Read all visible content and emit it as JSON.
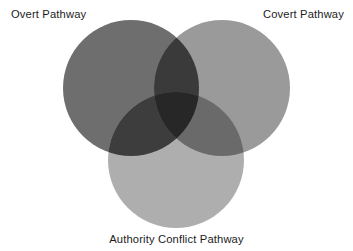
{
  "figure": {
    "type": "venn-diagram",
    "background_color": "#ffffff",
    "text_color": "#1c1c1c",
    "width": 353,
    "height": 251
  },
  "labels": {
    "overt": "Overt Pathway",
    "covert": "Covert Pathway",
    "authority": "Authority Conflict Pathway"
  },
  "chart_data": {
    "type": "venn",
    "title": "",
    "sets": [
      {
        "id": "overt",
        "label": "Overt Pathway",
        "fill": "#6e6e6e",
        "cx": 131,
        "cy": 88,
        "r": 68,
        "label_position": "top-left"
      },
      {
        "id": "covert",
        "label": "Covert Pathway",
        "fill": "#9a9a9a",
        "cx": 222,
        "cy": 88,
        "r": 68,
        "label_position": "top-right"
      },
      {
        "id": "authority",
        "label": "Authority Conflict Pathway",
        "fill": "#aeaeae",
        "cx": 176,
        "cy": 160,
        "r": 68,
        "label_position": "bottom-center"
      }
    ],
    "intersections": [
      {
        "sets": [
          "overt",
          "covert"
        ],
        "fill": "#3a3a3a"
      },
      {
        "sets": [
          "overt",
          "authority"
        ],
        "fill": "#3d3d3d"
      },
      {
        "sets": [
          "covert",
          "authority"
        ],
        "fill": "#6a6a6a"
      },
      {
        "sets": [
          "overt",
          "covert",
          "authority"
        ],
        "fill": "#272727"
      }
    ],
    "legend": "none",
    "grid": false
  }
}
